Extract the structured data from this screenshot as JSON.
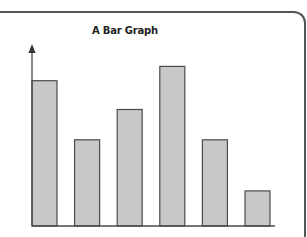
{
  "chart_data": {
    "type": "bar",
    "title": "A Bar Graph",
    "xlabel": "",
    "ylabel": "",
    "categories": [
      "1",
      "2",
      "3",
      "4",
      "5",
      "6"
    ],
    "values": [
      9.1,
      5.4,
      7.3,
      10.0,
      5.4,
      2.2
    ],
    "ylim": [
      0,
      11.4
    ],
    "value_note": "No axis ticks or labels shown; values are relative heights estimated from pixel lengths",
    "grid": false,
    "legend": null,
    "colors": {
      "bar_fill": "#c8c8c8",
      "bar_stroke": "#4a4a4a",
      "axis": "#4a4a4a",
      "frame": "#555555"
    }
  },
  "header": {
    "title": "A Bar Graph"
  }
}
